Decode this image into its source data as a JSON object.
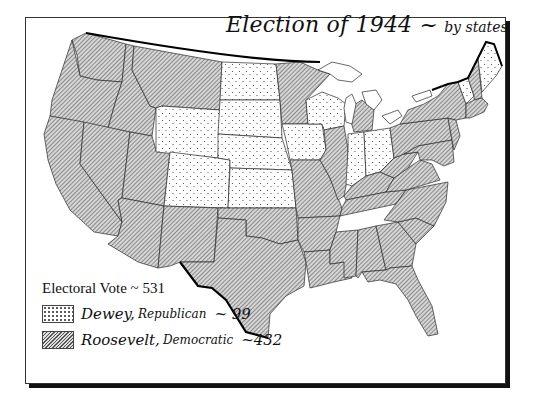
{
  "title": {
    "main": "Election of 1944 ~",
    "sub": "by states"
  },
  "legend": {
    "header": "Electoral Vote  ~ 531",
    "total_electoral_votes": 531,
    "entries": [
      {
        "candidate": "Dewey,",
        "party": "Republican",
        "votes_text": "~ 99",
        "votes": 99,
        "pattern": "stipple",
        "color": "#ffffff"
      },
      {
        "candidate": "Roosevelt,",
        "party": "Democratic",
        "votes_text": "~432",
        "votes": 432,
        "pattern": "hatch",
        "color": "#bdbdbd"
      }
    ]
  },
  "map": {
    "dewey_states": [
      "North Dakota",
      "South Dakota",
      "Nebraska",
      "Kansas",
      "Wyoming",
      "Colorado",
      "Iowa",
      "Wisconsin",
      "Indiana",
      "Ohio",
      "Maine",
      "Vermont"
    ],
    "roosevelt_states": "all other states",
    "colors": {
      "stroke": "#222222",
      "hatch": "#555555",
      "hatch_bg": "#d8d8d8",
      "stipple": "#444444",
      "border_bold": "#000000"
    }
  }
}
